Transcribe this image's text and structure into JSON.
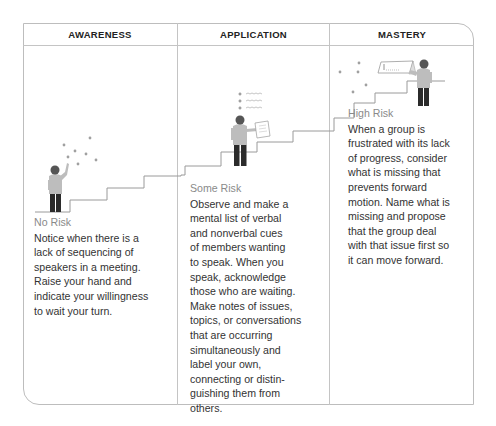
{
  "headers": [
    "AWARENESS",
    "APPLICATION",
    "MASTERY"
  ],
  "columns": [
    {
      "risk": "No Risk",
      "lines": [
        "Notice when there is a",
        "lack of sequencing of",
        "speakers in a meeting.",
        "Raise your hand and",
        "indicate your willingness",
        "to wait your turn."
      ]
    },
    {
      "risk": "Some Risk",
      "lines": [
        "Observe and make a",
        "mental list of verbal",
        "and nonverbal cues",
        "of members wanting",
        "to speak. When you",
        "speak, acknowledge",
        "those who are waiting.",
        "Make notes of issues,",
        "topics, or conversations",
        "that are occurring",
        "simultaneously and",
        "label your own,",
        "connecting or distin-",
        "guishing them from",
        "others."
      ]
    },
    {
      "risk": "High Risk",
      "lines": [
        "When a group is",
        "frustrated with its lack",
        "of progress, consider",
        "what is missing that",
        "prevents forward",
        "motion. Name what is",
        "missing and propose",
        "that the group deal",
        "with that issue first so",
        "it can move forward."
      ]
    }
  ],
  "colors": {
    "border": "#bdbdbd",
    "figure_head": "#555555",
    "figure_body": "#bdbdbd",
    "figure_legs": "#2b2b2b",
    "stairs": "#9a9a9a",
    "dots": "#9e9e9e"
  },
  "icons": [
    "person-raising-hand-icon",
    "person-reading-notes-icon",
    "person-at-whiteboard-icon"
  ]
}
